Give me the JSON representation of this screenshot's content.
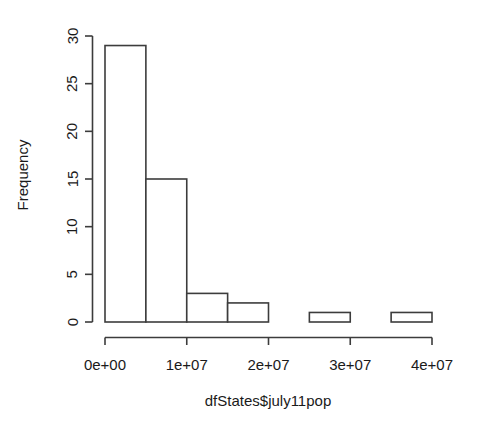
{
  "chart_data": {
    "type": "bar",
    "title": "",
    "subtitle": "",
    "xlabel": "dfStates$july11pop",
    "ylabel": "Frequency",
    "categories": [
      "0e+00–5e+06",
      "5e+06–1e+07",
      "1e+07–1.5e+07",
      "1.5e+07–2e+07",
      "2e+07–2.5e+07",
      "2.5e+07–3e+07",
      "3e+07–3.5e+07",
      "3.5e+07–4e+07"
    ],
    "bin_edges": [
      0,
      5000000,
      10000000,
      15000000,
      20000000,
      25000000,
      30000000,
      35000000,
      40000000
    ],
    "values": [
      29,
      15,
      3,
      2,
      0,
      1,
      0,
      1
    ],
    "bin_width": 5000000,
    "xlim": [
      0,
      40000000
    ],
    "ylim": [
      0,
      30
    ],
    "xticks": [
      0,
      10000000,
      20000000,
      30000000,
      40000000
    ],
    "xtick_labels": [
      "0e+00",
      "1e+07",
      "2e+07",
      "3e+07",
      "4e+07"
    ],
    "yticks": [
      0,
      5,
      10,
      15,
      20,
      25,
      30
    ],
    "ytick_labels": [
      "0",
      "5",
      "10",
      "15",
      "20",
      "25",
      "30"
    ],
    "grid": false,
    "legend": false,
    "legend_position": "none",
    "bar_fill": "#ffffff",
    "bar_stroke": "#3c3c3c",
    "axis_color": "#3c3c3c",
    "text_color": "#1a1a1a",
    "background": "#ffffff"
  },
  "axes": {
    "y_title": "Frequency",
    "x_title": "dfStates$july11pop"
  },
  "ticks": {
    "y": [
      "0",
      "5",
      "10",
      "15",
      "20",
      "25",
      "30"
    ],
    "x": [
      "0e+00",
      "1e+07",
      "2e+07",
      "3e+07",
      "4e+07"
    ]
  }
}
